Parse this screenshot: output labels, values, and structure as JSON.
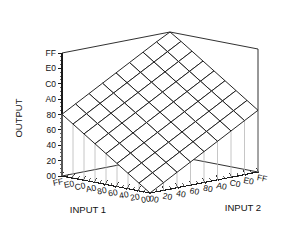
{
  "chart_data": {
    "type": "surface",
    "title": "",
    "xlabel": "INPUT 1",
    "ylabel": "INPUT 2",
    "zlabel": "OUTPUT",
    "grid": true,
    "legend": "none",
    "x_ticks": [
      "FF",
      "E0",
      "C0",
      "A0",
      "80",
      "60",
      "40",
      "20",
      "00"
    ],
    "y_ticks": [
      "00",
      "20",
      "40",
      "60",
      "80",
      "A0",
      "C0",
      "E0",
      "FF"
    ],
    "z_ticks": [
      "00",
      "20",
      "40",
      "60",
      "80",
      "A0",
      "C0",
      "E0",
      "FF"
    ],
    "xlim": [
      "00",
      "FF"
    ],
    "ylim": [
      "00",
      "FF"
    ],
    "zlim": [
      "00",
      "FF"
    ],
    "x_values": [
      0,
      32,
      64,
      96,
      128,
      160,
      192,
      224,
      255
    ],
    "y_values": [
      0,
      32,
      64,
      96,
      128,
      160,
      192,
      224,
      255
    ],
    "z_values": [
      0,
      32,
      64,
      96,
      128,
      160,
      192,
      224,
      255
    ],
    "corner_outputs": {
      "input1_FF_input2_00": "80",
      "input1_00_input2_FF": "80",
      "input1_FF_input2_FF": "FF",
      "input1_00_input2_00": "00"
    },
    "surface_z_matrix": [
      [
        0,
        16,
        32,
        48,
        64,
        80,
        96,
        112,
        128
      ],
      [
        16,
        32,
        48,
        64,
        80,
        96,
        112,
        128,
        144
      ],
      [
        32,
        48,
        64,
        80,
        96,
        112,
        128,
        144,
        160
      ],
      [
        48,
        64,
        80,
        96,
        112,
        128,
        144,
        160,
        176
      ],
      [
        64,
        80,
        96,
        112,
        128,
        144,
        160,
        176,
        192
      ],
      [
        80,
        96,
        112,
        128,
        144,
        160,
        176,
        192,
        208
      ],
      [
        96,
        112,
        128,
        144,
        160,
        176,
        192,
        208,
        224
      ],
      [
        112,
        128,
        144,
        160,
        176,
        192,
        208,
        224,
        240
      ],
      [
        128,
        144,
        160,
        176,
        192,
        208,
        224,
        240,
        255
      ]
    ],
    "colors": {
      "line": "#1a1a1a",
      "surface_fill": "#ffffff",
      "dropline": "#b8b8b8",
      "background": "#ffffff",
      "text": "#111111"
    }
  },
  "axes": {
    "output": {
      "title": "OUTPUT",
      "ticks": [
        "FF",
        "E0",
        "C0",
        "A0",
        "80",
        "60",
        "40",
        "20",
        "00"
      ]
    },
    "input1": {
      "title": "INPUT 1",
      "ticks": [
        "FF",
        "E0",
        "C0",
        "A0",
        "80",
        "60",
        "40",
        "20",
        "00"
      ]
    },
    "input2": {
      "title": "INPUT 2",
      "ticks": [
        "00",
        "20",
        "40",
        "60",
        "80",
        "A0",
        "C0",
        "E0",
        "FF"
      ]
    }
  }
}
